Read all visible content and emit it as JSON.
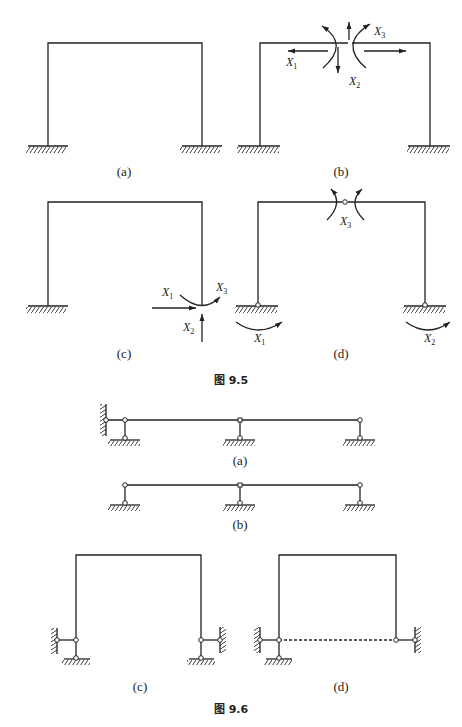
{
  "figure_9_5": {
    "caption": "图 9.5",
    "panels": [
      {
        "label": "(a)",
        "description": "fixed-fixed portal frame"
      },
      {
        "label": "(b)",
        "description": "frame cut at beam midspan with redundant forces",
        "forces": [
          "X1",
          "X2",
          "X3"
        ]
      },
      {
        "label": "(c)",
        "description": "right support released, redundants applied",
        "forces": [
          "X1",
          "X2",
          "X3"
        ]
      },
      {
        "label": "(d)",
        "description": "three-hinged frame with moment redundants",
        "forces": [
          "X1",
          "X2",
          "X3"
        ]
      }
    ]
  },
  "figure_9_6": {
    "caption": "图 9.6",
    "panels": [
      {
        "label": "(a)"
      },
      {
        "label": "(b)"
      },
      {
        "label": "(c)"
      },
      {
        "label": "(d)"
      }
    ]
  },
  "vars": {
    "x": "X",
    "s1": "1",
    "s2": "2",
    "s3": "3"
  },
  "colors": {
    "line": "#222222",
    "background": "#ffffff"
  }
}
